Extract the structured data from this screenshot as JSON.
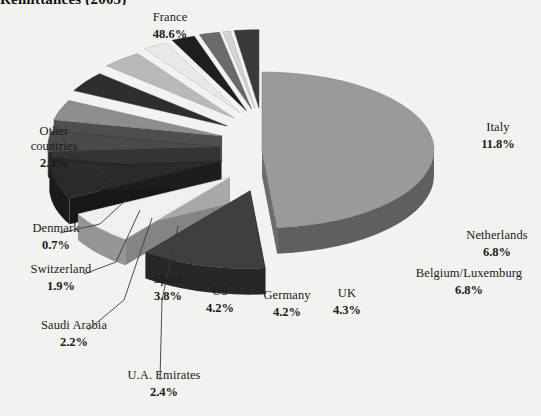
{
  "chart_data": {
    "type": "pie",
    "title": "Remittances (2003)",
    "xlabel": "",
    "ylabel": "",
    "legend": "none",
    "grid": false,
    "exploded": true,
    "three_d": true,
    "categories": [
      "France",
      "Italy",
      "Netherlands",
      "Belgium/Luxemburg",
      "UK",
      "Germany",
      "US",
      "Spain",
      "U.A. Emirates",
      "Saudi Arabia",
      "Switzerland",
      "Denmark",
      "Other countries"
    ],
    "values": [
      48.6,
      11.8,
      6.8,
      6.8,
      4.3,
      4.2,
      4.2,
      3.8,
      2.4,
      2.2,
      1.9,
      0.7,
      2.3
    ],
    "value_labels": [
      "48.6%",
      "11.8%",
      "6.8%",
      "6.8%",
      "4.3%",
      "4.2%",
      "4.2%",
      "3.8%",
      "2.4%",
      "2.2%",
      "1.9%",
      "0.7%",
      "2.3%"
    ],
    "unit": "%",
    "slice_colors": [
      "#9a9a9a",
      "#3f3f3f",
      "#f0f0ee",
      "#2a2a2a",
      "#4a4a4a",
      "#8e8e8e",
      "#2e2e2e",
      "#b9b9b9",
      "#e8e8e6",
      "#1f1f1f",
      "#6a6a6a",
      "#d4d4d2",
      "#3a3a3a"
    ]
  },
  "labels": {
    "france": {
      "name": "France",
      "pct": "48.6%"
    },
    "italy": {
      "name": "Italy",
      "pct": "11.8%"
    },
    "netherlands": {
      "name": "Netherlands",
      "pct": "6.8%"
    },
    "belgium": {
      "name": "Belgium/Luxemburg",
      "pct": "6.8%"
    },
    "uk": {
      "name": "UK",
      "pct": "4.3%"
    },
    "germany": {
      "name": "Germany",
      "pct": "4.2%"
    },
    "us": {
      "name": "US",
      "pct": "4.2%"
    },
    "spain": {
      "name": "Spain",
      "pct": "3.8%"
    },
    "uae": {
      "name": "U.A. Emirates",
      "pct": "2.4%"
    },
    "saudi": {
      "name": "Saudi Arabia",
      "pct": "2.2%"
    },
    "switzerland": {
      "name": "Switzerland",
      "pct": "1.9%"
    },
    "denmark": {
      "name": "Denmark",
      "pct": "0.7%"
    },
    "other": {
      "name_line1": "Other",
      "name_line2": "countries",
      "pct": "2.3%"
    }
  },
  "colors": {
    "background": "#f2f2f0",
    "text": "#1a1a1a",
    "leader_line": "#3a3a3a"
  }
}
